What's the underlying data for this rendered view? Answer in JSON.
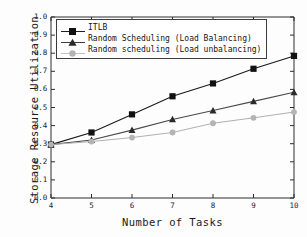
{
  "chart_data": {
    "type": "line",
    "title": "",
    "xlabel": "Number of Tasks",
    "ylabel": "Storage Resource Utilization",
    "x": [
      4,
      5,
      6,
      7,
      8,
      9,
      10
    ],
    "xlim": [
      4,
      10
    ],
    "ylim": [
      0.0,
      1.0
    ],
    "xticks": [
      "4",
      "5",
      "6",
      "7",
      "8",
      "9",
      "10"
    ],
    "yticks": [
      "0.0",
      "0.1",
      "0.2",
      "0.3",
      "0.4",
      "0.5",
      "0.6",
      "0.7",
      "0.8",
      "0.9",
      "1.0"
    ],
    "grid": false,
    "legend_position": "upper-left",
    "series": [
      {
        "name": "ITLB",
        "marker": "square",
        "color": "#1a1a1a",
        "values": [
          0.295,
          0.362,
          0.462,
          0.562,
          0.633,
          0.714,
          0.785
        ]
      },
      {
        "name": "Random Scheduling (Load Balancing)",
        "marker": "triangle",
        "color": "#4a4a4a",
        "values": [
          0.295,
          0.32,
          0.375,
          0.434,
          0.483,
          0.534,
          0.584
        ]
      },
      {
        "name": "Random scheduling (Load unbalancing)",
        "marker": "circle",
        "color": "#b0b0b0",
        "values": [
          0.295,
          0.312,
          0.334,
          0.362,
          0.413,
          0.443,
          0.475
        ]
      }
    ]
  },
  "axes": {
    "x_title": "Number of Tasks",
    "y_title": "Storage Resource Utilization"
  },
  "legend": {
    "entries": [
      {
        "label": "ITLB"
      },
      {
        "label": "Random Scheduling (Load Balancing)"
      },
      {
        "label": "Random scheduling (Load unbalancing)"
      }
    ]
  }
}
